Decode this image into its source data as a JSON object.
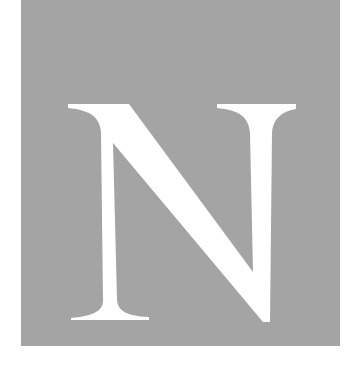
{
  "image": {
    "letter": "N",
    "colors": {
      "background": "#ffffff",
      "panel": "#a4a4a4",
      "letter": "#ffffff"
    }
  }
}
